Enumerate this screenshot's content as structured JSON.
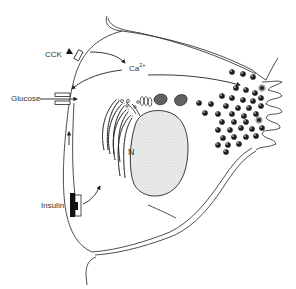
{
  "figure": {
    "labels": {
      "cck": "CCK",
      "calcium": "Ca",
      "calcium_charge": "2+",
      "glucose": "Glucose",
      "insulin": "Insulin",
      "nucleus": "N"
    },
    "structures": [
      "cell-membrane",
      "cck-receptor",
      "glucose-transporter",
      "insulin-receptor",
      "rough-endoplasmic-reticulum",
      "golgi-apparatus",
      "nucleus",
      "condensing-vacuoles",
      "zymogen-granules",
      "apical-microvilli"
    ],
    "arrows": [
      {
        "from": "cck-receptor",
        "to": "calcium"
      },
      {
        "from": "calcium",
        "to": "glucose-transporter"
      },
      {
        "from": "calcium",
        "to": "apical-granules"
      },
      {
        "from": "glucose",
        "to": "cell-interior"
      },
      {
        "from": "insulin-receptor",
        "to": "rough-endoplasmic-reticulum"
      },
      {
        "from": "lower-membrane",
        "to": "glucose-transporter"
      }
    ],
    "colors": {
      "ink": "#222222",
      "background": "#ffffff",
      "nucleus_fill": "#e6e6e6",
      "granule_fill": "#1e1e1e"
    }
  }
}
